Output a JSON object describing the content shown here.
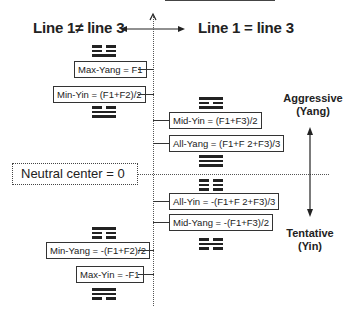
{
  "headings": {
    "left": "Line 1≠ line 3",
    "right": "Line 1 = line 3"
  },
  "axis_labels": {
    "top": "Aggressive",
    "top_sub": "(Yang)",
    "bottom": "Tentative",
    "bottom_sub": "(Yin)"
  },
  "neutral": "Neutral center = 0",
  "boxes": {
    "max_yang": "Max-Yang = F1",
    "min_yin": "Min-Yin = (F1+F2)/2",
    "mid_yin": "Mid-Yin = (F1+F3)/2",
    "all_yang": "All-Yang = (F1+F 2+F3)/3",
    "all_yin": "All-Yin = -(F1+F 2+F3)/3",
    "mid_yang": "Mid-Yang = -(F1+F3)/2",
    "min_yang": "Min-Yang = -(F1+F2)/2",
    "max_yin": "Max-Yin = -F1"
  },
  "trigrams": {
    "max_yang": [
      "broken",
      "broken",
      "solid"
    ],
    "min_yin": [
      "broken",
      "solid",
      "solid"
    ],
    "mid_yin": [
      "solid",
      "broken",
      "solid"
    ],
    "all_yang": [
      "solid",
      "solid",
      "solid"
    ],
    "all_yin": [
      "broken",
      "broken",
      "broken"
    ],
    "mid_yang": [
      "broken",
      "solid",
      "broken"
    ],
    "min_yang": [
      "solid",
      "broken",
      "broken"
    ],
    "max_yin": [
      "solid",
      "solid",
      "broken"
    ]
  }
}
